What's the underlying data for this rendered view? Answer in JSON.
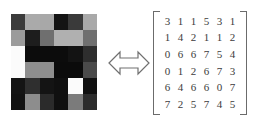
{
  "figure": {
    "type": "image-matrix-equivalence",
    "relation_icon": "double-headed-arrow-icon",
    "background_color": "#ffffff"
  },
  "pixel_image": {
    "label": "grayscale pixel image",
    "rows": 6,
    "cols": 6,
    "colors": [
      [
        "#3b3b3b",
        "#aaaaaa",
        "#a8a8a8",
        "#141414",
        "#3a3a3a",
        "#a9a9a9"
      ],
      [
        "#9b9b9b",
        "#1d1d1d",
        "#6f6f6f",
        "#b0b0b0",
        "#b0b0b0",
        "#6f6f6f"
      ],
      [
        "#fbfbfb",
        "#0c0c0c",
        "#0c0c0c",
        "#0c0c0c",
        "#131313",
        "#2e2e2e"
      ],
      [
        "#fbfbfb",
        "#8e8e8e",
        "#8e8e8e",
        "#0b0b0b",
        "#0b0b0b",
        "#4a4a4a"
      ],
      [
        "#141414",
        "#2f2f2f",
        "#141414",
        "#101010",
        "#fbfbfb",
        "#101010"
      ],
      [
        "#121212",
        "#8d8d8d",
        "#2b2b2b",
        "#101010",
        "#7b7b7b",
        "#2c2c2c"
      ]
    ]
  },
  "matrix": {
    "label": "pixel value matrix",
    "rows": 6,
    "cols": 6,
    "bracket_color": "#6b6b6b",
    "text_color": "#3c3c3c",
    "values": [
      [
        3,
        1,
        1,
        5,
        3,
        1
      ],
      [
        1,
        4,
        2,
        1,
        1,
        2
      ],
      [
        0,
        6,
        6,
        7,
        5,
        4
      ],
      [
        0,
        1,
        2,
        6,
        7,
        3
      ],
      [
        6,
        4,
        6,
        6,
        0,
        7
      ],
      [
        7,
        2,
        5,
        7,
        4,
        5
      ]
    ]
  }
}
